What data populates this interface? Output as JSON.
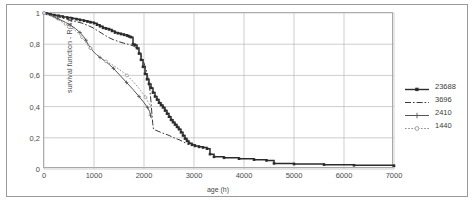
{
  "chart_data": {
    "type": "line",
    "title": "",
    "xlabel": "age (h)",
    "ylabel": "survival function - R(Xz)",
    "xlim": [
      0,
      7000
    ],
    "ylim": [
      0,
      1
    ],
    "xticks": [
      "0",
      "1000",
      "2000",
      "3000",
      "4000",
      "5000",
      "6000",
      "7000"
    ],
    "xtick_values": [
      0,
      1000,
      2000,
      3000,
      4000,
      5000,
      6000,
      7000
    ],
    "yticks": [
      "0",
      "0,2",
      "0,4",
      "0,6",
      "0,8",
      "1"
    ],
    "ytick_values": [
      0,
      0.2,
      0.4,
      0.6,
      0.8,
      1
    ],
    "grid": true,
    "legend_position": "right",
    "series": [
      {
        "name": "23688",
        "style": "solid-square",
        "color": "#2b2b2b",
        "points": [
          [
            0,
            1.0
          ],
          [
            60,
            0.995
          ],
          [
            130,
            0.99
          ],
          [
            210,
            0.985
          ],
          [
            300,
            0.98
          ],
          [
            380,
            0.975
          ],
          [
            470,
            0.97
          ],
          [
            560,
            0.965
          ],
          [
            650,
            0.96
          ],
          [
            720,
            0.955
          ],
          [
            800,
            0.95
          ],
          [
            870,
            0.945
          ],
          [
            930,
            0.94
          ],
          [
            1000,
            0.935
          ],
          [
            1060,
            0.925
          ],
          [
            1120,
            0.915
          ],
          [
            1180,
            0.905
          ],
          [
            1240,
            0.9
          ],
          [
            1300,
            0.895
          ],
          [
            1360,
            0.885
          ],
          [
            1420,
            0.875
          ],
          [
            1480,
            0.87
          ],
          [
            1540,
            0.865
          ],
          [
            1600,
            0.86
          ],
          [
            1660,
            0.855
          ],
          [
            1700,
            0.85
          ],
          [
            1740,
            0.845
          ],
          [
            1780,
            0.8
          ],
          [
            1820,
            0.795
          ],
          [
            1860,
            0.775
          ],
          [
            1900,
            0.74
          ],
          [
            1940,
            0.7
          ],
          [
            1980,
            0.655
          ],
          [
            2020,
            0.61
          ],
          [
            2060,
            0.575
          ],
          [
            2100,
            0.545
          ],
          [
            2140,
            0.52
          ],
          [
            2180,
            0.49
          ],
          [
            2220,
            0.465
          ],
          [
            2260,
            0.445
          ],
          [
            2300,
            0.425
          ],
          [
            2340,
            0.41
          ],
          [
            2380,
            0.395
          ],
          [
            2420,
            0.375
          ],
          [
            2460,
            0.355
          ],
          [
            2500,
            0.335
          ],
          [
            2540,
            0.315
          ],
          [
            2580,
            0.3
          ],
          [
            2620,
            0.285
          ],
          [
            2660,
            0.27
          ],
          [
            2700,
            0.255
          ],
          [
            2740,
            0.235
          ],
          [
            2780,
            0.215
          ],
          [
            2820,
            0.195
          ],
          [
            2860,
            0.18
          ],
          [
            2900,
            0.165
          ],
          [
            2960,
            0.155
          ],
          [
            3020,
            0.148
          ],
          [
            3100,
            0.142
          ],
          [
            3180,
            0.138
          ],
          [
            3260,
            0.13
          ],
          [
            3320,
            0.095
          ],
          [
            3400,
            0.078
          ],
          [
            3600,
            0.072
          ],
          [
            3900,
            0.066
          ],
          [
            4200,
            0.06
          ],
          [
            4450,
            0.055
          ],
          [
            4600,
            0.036
          ],
          [
            5000,
            0.032
          ],
          [
            5600,
            0.028
          ],
          [
            6200,
            0.024
          ],
          [
            7000,
            0.02
          ]
        ]
      },
      {
        "name": "3696",
        "style": "dash-dot",
        "color": "#3a3a3a",
        "points": [
          [
            0,
            1.0
          ],
          [
            120,
            0.99
          ],
          [
            260,
            0.98
          ],
          [
            400,
            0.965
          ],
          [
            520,
            0.955
          ],
          [
            640,
            0.945
          ],
          [
            760,
            0.935
          ],
          [
            880,
            0.92
          ],
          [
            980,
            0.905
          ],
          [
            1080,
            0.885
          ],
          [
            1180,
            0.865
          ],
          [
            1280,
            0.845
          ],
          [
            1380,
            0.83
          ],
          [
            1480,
            0.818
          ],
          [
            1580,
            0.808
          ],
          [
            1680,
            0.8
          ],
          [
            1780,
            0.79
          ],
          [
            1860,
            0.775
          ],
          [
            1920,
            0.745
          ],
          [
            1980,
            0.7
          ],
          [
            2040,
            0.64
          ],
          [
            2090,
            0.57
          ],
          [
            2120,
            0.5
          ],
          [
            2140,
            0.43
          ],
          [
            2160,
            0.345
          ],
          [
            2175,
            0.29
          ],
          [
            2190,
            0.255
          ],
          [
            2260,
            0.245
          ],
          [
            2360,
            0.232
          ],
          [
            2480,
            0.218
          ],
          [
            2600,
            0.2
          ],
          [
            2720,
            0.185
          ],
          [
            2820,
            0.168
          ],
          [
            2900,
            0.155
          ]
        ]
      },
      {
        "name": "2410",
        "style": "plus",
        "color": "#555555",
        "points": [
          [
            0,
            1.0
          ],
          [
            130,
            0.985
          ],
          [
            270,
            0.965
          ],
          [
            400,
            0.945
          ],
          [
            520,
            0.925
          ],
          [
            630,
            0.9
          ],
          [
            720,
            0.875
          ],
          [
            790,
            0.85
          ],
          [
            840,
            0.825
          ],
          [
            880,
            0.8
          ],
          [
            930,
            0.775
          ],
          [
            1010,
            0.745
          ],
          [
            1120,
            0.715
          ],
          [
            1250,
            0.685
          ],
          [
            1390,
            0.645
          ],
          [
            1520,
            0.6
          ],
          [
            1650,
            0.555
          ],
          [
            1780,
            0.51
          ],
          [
            1900,
            0.465
          ],
          [
            2000,
            0.425
          ],
          [
            2070,
            0.395
          ],
          [
            2110,
            0.37
          ],
          [
            2130,
            0.345
          ],
          [
            2145,
            0.325
          ]
        ]
      },
      {
        "name": "1440",
        "style": "dotted-circle",
        "color": "#8c8c8c",
        "points": [
          [
            0,
            1.0
          ],
          [
            140,
            0.98
          ],
          [
            290,
            0.955
          ],
          [
            430,
            0.93
          ],
          [
            560,
            0.905
          ],
          [
            670,
            0.875
          ],
          [
            760,
            0.845
          ],
          [
            830,
            0.815
          ],
          [
            880,
            0.79
          ],
          [
            930,
            0.775
          ],
          [
            1010,
            0.745
          ],
          [
            1120,
            0.715
          ],
          [
            1240,
            0.69
          ],
          [
            1380,
            0.665
          ],
          [
            1520,
            0.635
          ],
          [
            1660,
            0.6
          ],
          [
            1800,
            0.555
          ],
          [
            1930,
            0.505
          ],
          [
            2030,
            0.46
          ],
          [
            2100,
            0.42
          ],
          [
            2150,
            0.385
          ]
        ]
      }
    ]
  },
  "legend": {
    "items": [
      {
        "label": "23688"
      },
      {
        "label": "3696"
      },
      {
        "label": "2410"
      },
      {
        "label": "1440"
      }
    ]
  }
}
